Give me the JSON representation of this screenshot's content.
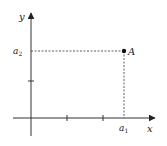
{
  "diagram": {
    "type": "cartesian-point-projection",
    "axes": {
      "x_label": "x",
      "y_label": "y",
      "origin_px": [
        31,
        118
      ],
      "x_axis_range_px": [
        13,
        156
      ],
      "y_axis_range_px": [
        136,
        12
      ]
    },
    "ticks": {
      "x_px": [
        67,
        103
      ],
      "y_px": [
        81
      ]
    },
    "point": {
      "label": "A",
      "px": [
        124,
        51
      ],
      "x_coord_label": "a",
      "x_coord_sub": "1",
      "y_coord_label": "a",
      "y_coord_sub": "2"
    },
    "colors": {
      "axis": "#333333",
      "dashed": "#333333",
      "point": "#111111",
      "text": "#222222"
    }
  }
}
